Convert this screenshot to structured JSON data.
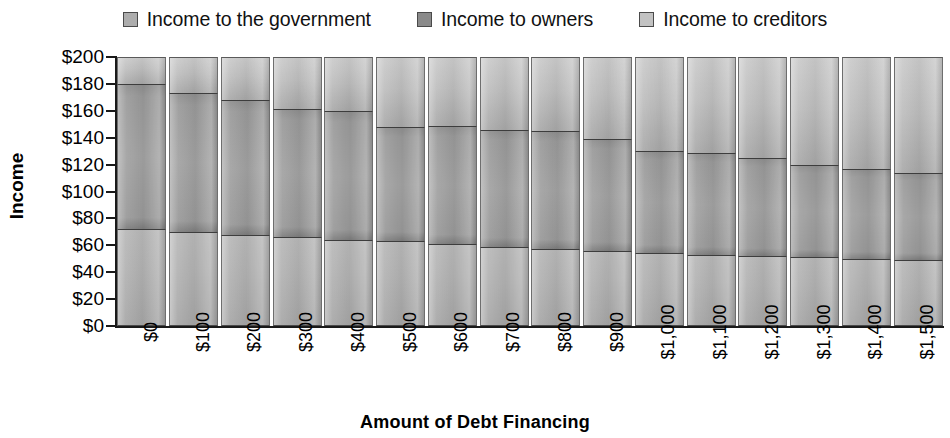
{
  "chart_data": {
    "type": "bar",
    "stacked": true,
    "title": "",
    "xlabel": "Amount of Debt Financing",
    "ylabel": "Income",
    "ylim": [
      0,
      200
    ],
    "ytick_step": 20,
    "grid": false,
    "legend_position": "top-center",
    "categories": [
      "$0",
      "$100",
      "$200",
      "$300",
      "$400",
      "$500",
      "$600",
      "$700",
      "$800",
      "$900",
      "$1,000",
      "$1,100",
      "$1,200",
      "$1,300",
      "$1,400",
      "$1,500"
    ],
    "ytick_labels": [
      "$200",
      "$180",
      "$160",
      "$140",
      "$120",
      "$100",
      "$80",
      "$60",
      "$40",
      "$20",
      "$0"
    ],
    "series": [
      {
        "name": "Income to creditors",
        "color": "#b4b4b4",
        "values": [
          72,
          70,
          68,
          66,
          64,
          63,
          61,
          59,
          57,
          56,
          54,
          53,
          52,
          51,
          50,
          49
        ]
      },
      {
        "name": "Income to owners",
        "color": "#9e9e9e",
        "values": [
          108,
          103,
          100,
          95,
          96,
          85,
          88,
          87,
          88,
          83,
          76,
          76,
          73,
          69,
          67,
          65
        ]
      },
      {
        "name": "Income to the government",
        "color": "#c4c4c4",
        "values": [
          20,
          27,
          32,
          39,
          40,
          52,
          51,
          54,
          55,
          61,
          70,
          71,
          75,
          80,
          83,
          86
        ]
      }
    ],
    "stack_tops": {
      "creditors": [
        72,
        70,
        68,
        66,
        64,
        63,
        61,
        59,
        57,
        56,
        54,
        53,
        52,
        51,
        50,
        49
      ],
      "owners": [
        180,
        173,
        168,
        161,
        160,
        148,
        149,
        146,
        145,
        139,
        130,
        129,
        125,
        120,
        117,
        114
      ],
      "total": [
        200,
        200,
        200,
        200,
        200,
        200,
        200,
        200,
        200,
        200,
        200,
        200,
        200,
        200,
        200,
        200
      ]
    }
  },
  "legend": {
    "items": [
      {
        "label": "Income to the government",
        "color": "#adadad"
      },
      {
        "label": "Income to owners",
        "color": "#8a8a8a"
      },
      {
        "label": "Income to creditors",
        "color": "#c2c2c2"
      }
    ]
  },
  "axes": {
    "y_title": "Income",
    "x_title": "Amount of Debt Financing"
  }
}
